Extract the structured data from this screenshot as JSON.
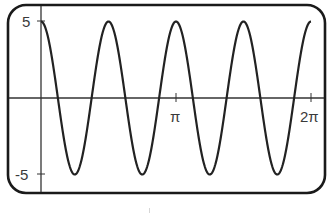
{
  "chart_data": {
    "type": "line",
    "title": "",
    "xlabel": "",
    "ylabel": "",
    "function": "y = 5cos(4x)",
    "amplitude": 5,
    "angular_frequency": 4,
    "xlim": [
      0,
      6.2832
    ],
    "ylim": [
      -5,
      5
    ],
    "grid": false,
    "legend": null,
    "x_ticks": [
      {
        "value": 3.1416,
        "label": "π"
      },
      {
        "value": 6.2832,
        "label": "2π"
      }
    ],
    "y_ticks": [
      {
        "value": 5,
        "label": "5"
      },
      {
        "value": -5,
        "label": "-5"
      }
    ],
    "series": [
      {
        "name": "5cos(4x)",
        "x": [
          0,
          0.3927,
          0.7854,
          1.1781,
          1.5708,
          1.9635,
          2.3562,
          2.7489,
          3.1416,
          3.5343,
          3.927,
          4.3197,
          4.7124,
          5.1051,
          5.4978,
          5.8905,
          6.2832
        ],
        "values": [
          5,
          0,
          -5,
          0,
          5,
          0,
          -5,
          0,
          5,
          0,
          -5,
          0,
          5,
          0,
          -5,
          0,
          5
        ]
      }
    ],
    "line_color": "#222222",
    "axis_color": "#333333",
    "frame_color": "#1a1a1a"
  },
  "labels": {
    "y_max": "5",
    "y_min": "-5",
    "x_pi": "π",
    "x_2pi": "2π"
  },
  "layout": {
    "origin_px": [
      41,
      98
    ],
    "px_per_unit_x": 42.97,
    "px_per_unit_y": 15.3,
    "frame": {
      "x": 8,
      "y": 5,
      "w": 317,
      "h": 188,
      "r": 18
    }
  }
}
